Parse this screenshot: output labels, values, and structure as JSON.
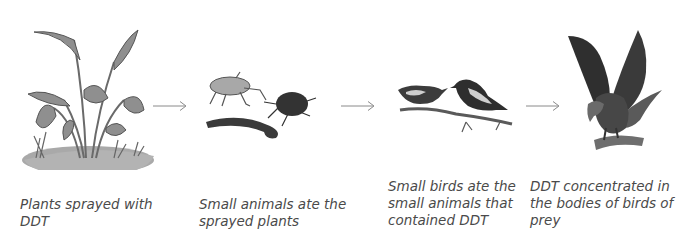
{
  "diagram": {
    "stages": [
      {
        "id": "plants",
        "icon": "plant-icon",
        "caption_lines": [
          "Plants sprayed with",
          "DDT"
        ]
      },
      {
        "id": "small-animals",
        "icon": "insects-icon",
        "caption_lines": [
          "Small animals ate the",
          "sprayed plants"
        ]
      },
      {
        "id": "small-birds",
        "icon": "small-birds-icon",
        "caption_lines": [
          "Small birds ate the",
          "small animals that",
          "contained DDT"
        ]
      },
      {
        "id": "birds-of-prey",
        "icon": "eagle-icon",
        "caption_lines": [
          "DDT concentrated in",
          "the bodies of birds of",
          "prey"
        ]
      }
    ],
    "arrows": [
      "arrow-right-icon",
      "arrow-right-icon",
      "arrow-right-icon"
    ]
  }
}
